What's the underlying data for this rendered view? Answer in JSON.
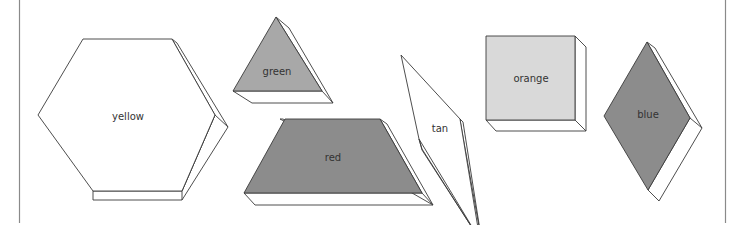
{
  "colors": {
    "outline": "#3a3a3a",
    "side_face": "#ffffff",
    "yellow_fill": "#ffffff",
    "green_fill": "#a8a8a8",
    "red_fill": "#8c8c8c",
    "tan_fill": "#ffffff",
    "orange_fill": "#d9d9d9",
    "blue_fill": "#8c8c8c",
    "frame_line": "#8a8a8a"
  },
  "blocks": [
    {
      "id": "yellow",
      "shape": "hexagon",
      "label": "yellow"
    },
    {
      "id": "green",
      "shape": "triangle",
      "label": "green"
    },
    {
      "id": "red",
      "shape": "trapezoid",
      "label": "red"
    },
    {
      "id": "tan",
      "shape": "thin-rhombus",
      "label": "tan"
    },
    {
      "id": "orange",
      "shape": "square",
      "label": "orange"
    },
    {
      "id": "blue",
      "shape": "rhombus",
      "label": "blue"
    }
  ]
}
